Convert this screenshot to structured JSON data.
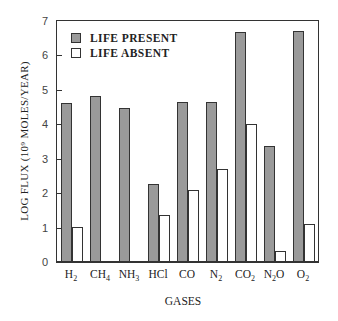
{
  "chart_data": {
    "type": "bar",
    "title": "",
    "xlabel": "GASES",
    "ylabel": "LOG FLUX (10⁹ MOLES/YEAR)",
    "ylim": [
      0,
      7
    ],
    "yticks": [
      0,
      1,
      2,
      3,
      4,
      5,
      6,
      7
    ],
    "categories": [
      "H2",
      "CH4",
      "NH3",
      "HCl",
      "CO",
      "N2",
      "CO2",
      "N2O",
      "O2"
    ],
    "series": [
      {
        "name": "LIFE PRESENT",
        "color": "#9a9a9a",
        "values": [
          4.6,
          4.8,
          4.45,
          2.25,
          4.63,
          4.63,
          6.65,
          3.34,
          6.68
        ]
      },
      {
        "name": "LIFE ABSENT",
        "color": "#ffffff",
        "values": [
          1.0,
          0,
          0,
          1.33,
          2.05,
          2.68,
          3.97,
          0.29,
          1.07
        ]
      }
    ],
    "legend": {
      "position": "upper-left",
      "entries": [
        "LIFE PRESENT",
        "LIFE ABSENT"
      ]
    },
    "grid": false
  },
  "labels": {
    "ylabel_text": "LOG FLUX (10⁹ MOLES/YEAR)",
    "xlabel_text": "GASES",
    "legend_present": "LIFE PRESENT",
    "legend_absent": "LIFE ABSENT"
  }
}
